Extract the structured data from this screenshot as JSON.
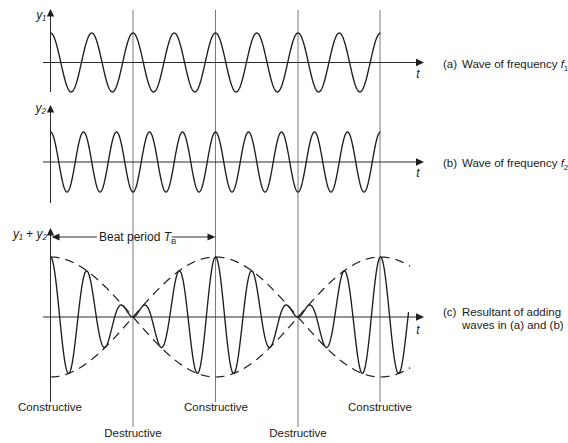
{
  "figure": {
    "beat_period": {
      "text": "Beat period ",
      "symbol": "T",
      "subscript": "B"
    },
    "annotations": [
      {
        "label": "Constructive",
        "t": 0
      },
      {
        "label": "Destructive",
        "t": 0.5
      },
      {
        "label": "Constructive",
        "t": 1
      },
      {
        "label": "Destructive",
        "t": 1.5
      },
      {
        "label": "Constructive",
        "t": 2
      }
    ]
  },
  "chart_data": [
    {
      "panel": "a",
      "type": "line",
      "title": "",
      "ylabel": "y₁",
      "xlabel": "t",
      "caption": {
        "tag": "(a)",
        "text": "Wave of frequency ",
        "symbol": "f",
        "subscript": "1"
      },
      "x_unit": "beat period T_B",
      "xlim": [
        0,
        2
      ],
      "ylim": [
        -1,
        1
      ],
      "grid": false,
      "series": [
        {
          "name": "y1",
          "kind": "cosine",
          "amplitude": 1,
          "frequency_per_TB": 4,
          "t_range": [
            0,
            2
          ],
          "x": [
            0,
            0.125,
            0.25,
            0.375,
            0.5,
            0.625,
            0.75,
            0.875,
            1,
            1.125,
            1.25,
            1.375,
            1.5,
            1.625,
            1.75,
            1.875,
            2
          ],
          "values": [
            1,
            -1,
            1,
            -1,
            1,
            -1,
            1,
            -1,
            1,
            -1,
            1,
            -1,
            1,
            -1,
            1,
            -1,
            1
          ]
        }
      ]
    },
    {
      "panel": "b",
      "type": "line",
      "title": "",
      "ylabel": "y₂",
      "xlabel": "t",
      "caption": {
        "tag": "(b)",
        "text": "Wave of frequency ",
        "symbol": "f",
        "subscript": "2"
      },
      "x_unit": "beat period T_B",
      "xlim": [
        0,
        2
      ],
      "ylim": [
        -1,
        1
      ],
      "grid": false,
      "series": [
        {
          "name": "y2",
          "kind": "cosine",
          "amplitude": 1,
          "frequency_per_TB": 5,
          "t_range": [
            0,
            2
          ],
          "x": [
            0,
            0.1,
            0.2,
            0.3,
            0.4,
            0.5,
            0.6,
            0.7,
            0.8,
            0.9,
            1,
            1.1,
            1.2,
            1.3,
            1.4,
            1.5,
            1.6,
            1.7,
            1.8,
            1.9,
            2
          ],
          "values": [
            1,
            -1,
            1,
            -1,
            1,
            -1,
            1,
            -1,
            1,
            -1,
            1,
            -1,
            1,
            -1,
            1,
            -1,
            1,
            -1,
            1,
            -1,
            1
          ]
        }
      ]
    },
    {
      "panel": "c",
      "type": "line",
      "title": "",
      "ylabel": "y₁ + y₂",
      "xlabel": "t",
      "caption": {
        "tag": "(c)",
        "lines": [
          "Resultant of adding",
          "waves in (a) and (b)"
        ]
      },
      "x_unit": "beat period T_B",
      "xlim": [
        0,
        2.18
      ],
      "ylim": [
        -2,
        2
      ],
      "grid": false,
      "series": [
        {
          "name": "y1 + y2",
          "kind": "sum",
          "components": [
            {
              "amplitude": 1,
              "frequency_per_TB": 4
            },
            {
              "amplitude": 1,
              "frequency_per_TB": 5
            }
          ],
          "t_range": [
            0,
            2.17
          ],
          "x": [
            0,
            0.5,
            1,
            1.5,
            2
          ],
          "values": [
            2,
            0,
            2,
            0,
            2
          ]
        },
        {
          "name": "envelope (upper, dashed)",
          "kind": "envelope",
          "sign": 1,
          "amplitude": 2,
          "t_range": [
            0,
            2.18
          ],
          "x": [
            0,
            0.5,
            1,
            1.5,
            2
          ],
          "values": [
            2,
            0,
            -2,
            0,
            2
          ]
        },
        {
          "name": "envelope (lower, dashed)",
          "kind": "envelope",
          "sign": -1,
          "amplitude": 2,
          "t_range": [
            0,
            2.18
          ],
          "x": [
            0,
            0.5,
            1,
            1.5,
            2
          ],
          "values": [
            -2,
            0,
            2,
            0,
            -2
          ]
        }
      ]
    }
  ]
}
